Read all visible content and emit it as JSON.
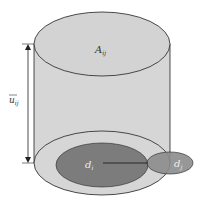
{
  "diagram": {
    "top_label": "A",
    "top_label_sub": "ij",
    "height_label": "u",
    "height_label_sub": "ij",
    "inner_label": "d",
    "inner_label_sub": "i",
    "outer_label": "d",
    "outer_label_sub": "j",
    "colors": {
      "cylinder_fill": "#d6d6d6",
      "inner_disk": "#7c7c7c",
      "outer_disk": "#8c8c8c",
      "stroke": "#222222"
    }
  }
}
